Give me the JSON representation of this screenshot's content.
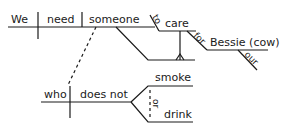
{
  "diagram": {
    "type": "Reed-Kellogg sentence diagram",
    "sentence": "We need someone to care for Bessie (cow), who does not smoke or drink.",
    "main_clause": {
      "subject": "We",
      "verb": "need",
      "object": "someone"
    },
    "infinitive_phrase": {
      "marker": "to",
      "verb": "care",
      "preposition": "for",
      "prep_object": "Bessie (cow)",
      "modifier": "our"
    },
    "relative_clause": {
      "subject": "who",
      "verb_phrase": "does not",
      "compound_verbs": [
        "smoke",
        "drink"
      ],
      "conjunction": "or"
    },
    "colors": {
      "ink": "#1a1a1a",
      "background": "#ffffff"
    }
  }
}
